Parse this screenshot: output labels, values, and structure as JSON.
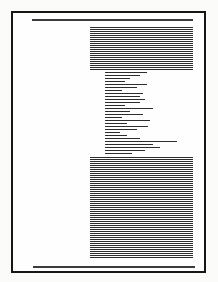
{
  "document_thumbnail": {
    "description": "greeked-page-preview",
    "colors": {
      "canvas_background": "#fbfbfa",
      "page_background": "#fefefe",
      "page_border": "#161616",
      "rule": "#3b3b3b",
      "text_line": "#2d2d2d"
    },
    "page_geometry": {
      "x": 11,
      "y": 11,
      "width": 195,
      "height": 262,
      "border_px": 2
    },
    "blocks": [
      {
        "name": "header-rule",
        "type": "rule",
        "x": 32,
        "y": 19,
        "width": 161,
        "height": 2
      },
      {
        "name": "paragraph-block-top",
        "type": "dense",
        "x": 90,
        "y": 27,
        "width": 103,
        "height": 44,
        "line_period": 2,
        "line_thickness": 1
      },
      {
        "name": "ragged-line-block",
        "type": "ragged",
        "x": 105,
        "y": 72,
        "line_period": 3,
        "line_thickness": 1,
        "line_lengths": [
          42,
          35,
          25,
          20,
          42,
          32,
          17,
          38,
          35,
          40,
          35,
          20,
          48,
          25,
          38,
          17,
          45,
          22,
          43,
          32,
          15,
          22,
          35,
          72,
          48,
          55,
          40,
          27
        ]
      },
      {
        "name": "paragraph-block-bottom",
        "type": "dense",
        "x": 90,
        "y": 157,
        "width": 103,
        "height": 102,
        "line_period": 2,
        "line_thickness": 1
      },
      {
        "name": "footer-rule",
        "type": "rule",
        "x": 33,
        "y": 266,
        "width": 162,
        "height": 2
      }
    ]
  }
}
